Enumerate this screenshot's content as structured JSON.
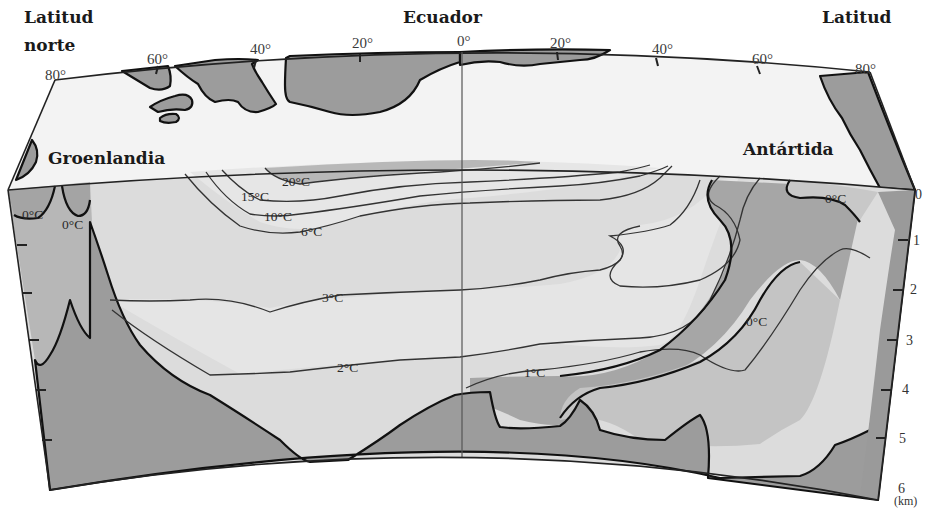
{
  "figure": {
    "title": "Ecuador",
    "left_header": [
      "Latitud",
      "norte"
    ],
    "right_header": "Latitud",
    "landmasses": {
      "left": "Groenlandia",
      "right": "Antártida"
    },
    "latitude_ticks_north": [
      "80°",
      "60°",
      "40°",
      "20°"
    ],
    "equator_tick": "0°",
    "latitude_ticks_south": [
      "20°",
      "40°",
      "60°",
      "80°"
    ],
    "depth_axis": {
      "ticks": [
        "0",
        "1",
        "2",
        "3",
        "4",
        "5",
        "6"
      ],
      "unit": "(km)"
    },
    "isotherms": [
      {
        "label": "20°C"
      },
      {
        "label": "15°C"
      },
      {
        "label": "10°C"
      },
      {
        "label": "6°C"
      },
      {
        "label": "3°C"
      },
      {
        "label": "2°C"
      },
      {
        "label": "1°C"
      },
      {
        "label": "0°C",
        "location": "Groenlandia surface (left)"
      },
      {
        "label": "0°C",
        "location": "Groenlandia surface (right)"
      },
      {
        "label": "0°C",
        "location": "Antártida surface"
      },
      {
        "label": "0°C",
        "location": "Antarctic bottom water tongue"
      }
    ],
    "colors": {
      "land_and_bottom": "#9c9c9c",
      "cold_water": "#a9a9a9",
      "mid_water": "#d2d2d2",
      "warm_water": "#e4e4e4",
      "surface_band": "#f2f2f2",
      "outline": "#111111"
    }
  }
}
